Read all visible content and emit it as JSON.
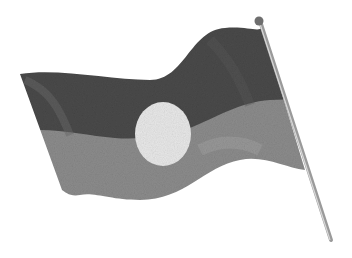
{
  "image": {
    "alt": "Pencil drawing of a waving flag on a pole, dark upper half, lighter lower half, light circle in center",
    "colors": {
      "background": "#ffffff",
      "flag_top": "#4a4a4a",
      "flag_bottom": "#8c8c8c",
      "circle": "#e8e8e8",
      "pole": "#9a9a9a",
      "finial": "#6e6e6e"
    }
  }
}
